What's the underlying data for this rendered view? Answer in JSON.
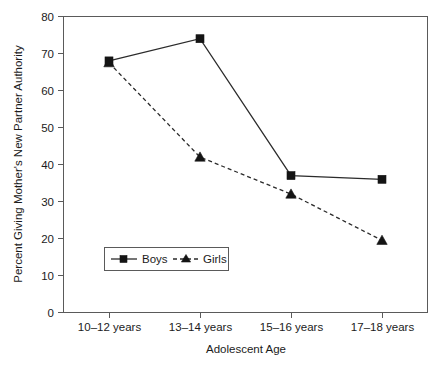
{
  "chart_data": {
    "type": "line",
    "title": "",
    "xlabel": "Adolescent Age",
    "ylabel": "Percent Giving Mother's New Partner Authority",
    "categories": [
      "10–12 years",
      "13–14 years",
      "15–16 years",
      "17–18 years"
    ],
    "ylim": [
      0,
      80
    ],
    "yticks": [
      0,
      10,
      20,
      30,
      40,
      50,
      60,
      70,
      80
    ],
    "ytick_labels": [
      "0",
      "10",
      "20",
      "30",
      "40",
      "50",
      "60",
      "70",
      "80"
    ],
    "grid": false,
    "legend_position": "lower-left-inside",
    "series": [
      {
        "name": "Boys",
        "values": [
          68,
          74,
          37,
          36
        ],
        "line_style": "solid",
        "marker": "square",
        "color": "#141414"
      },
      {
        "name": "Girls",
        "values": [
          67.5,
          42,
          32,
          19.5
        ],
        "line_style": "dashed",
        "marker": "triangle",
        "color": "#141414"
      }
    ]
  },
  "legend": {
    "entries": [
      {
        "label": "Boys",
        "marker": "square-marker",
        "line": "solid-line"
      },
      {
        "label": "Girls",
        "marker": "triangle-marker",
        "line": "dashed-line"
      }
    ]
  },
  "colors": {
    "background": "#ffffff",
    "axis": "#5a5a5a",
    "ink": "#141414"
  }
}
